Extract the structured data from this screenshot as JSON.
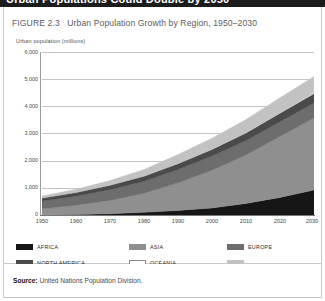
{
  "page_header": {
    "title": "Urban Populations Could Double by 2050"
  },
  "figure": {
    "caption_number": "FIGURE 2.3",
    "caption_title": "Urban Population Growth by Region, 1950–2030",
    "axis_title": "Urban population (millions)"
  },
  "source": {
    "label": "Source:",
    "text": "United Nations Population Division."
  },
  "legend": {
    "items": [
      {
        "label": "AFRICA",
        "color": "#161616"
      },
      {
        "label": "ASIA",
        "color": "#8f8f8f"
      },
      {
        "label": "EUROPE",
        "color": "#6d6d6d"
      },
      {
        "label": "NORTH AMERICA",
        "color": "#4a4a4a"
      },
      {
        "label": "OCEANIA",
        "color": "#ffffff"
      },
      {
        "label": "SOUTH AND CENTRAL AMERICA",
        "color": "#c2c2c2"
      }
    ]
  },
  "chart_data": {
    "type": "area",
    "title": "Urban Population Growth by Region, 1950–2030",
    "subtitle": "FIGURE 2.3",
    "xlabel": "",
    "ylabel": "Urban population (millions)",
    "stacked": true,
    "grid": true,
    "legend_position": "bottom",
    "xlim": [
      1950,
      2030
    ],
    "ylim": [
      0,
      6000
    ],
    "ytick_labels": [
      "0",
      "1,000",
      "2,000",
      "3,000",
      "4,000",
      "5,000",
      "6,000"
    ],
    "ytick_values": [
      0,
      1000,
      2000,
      3000,
      4000,
      5000,
      6000
    ],
    "xtick_labels": [
      "1950",
      "1960",
      "1970",
      "1980",
      "1990",
      "2000",
      "2010",
      "2020",
      "2030"
    ],
    "x": [
      1950,
      1960,
      1970,
      1980,
      1990,
      2000,
      2010,
      2020,
      2030
    ],
    "series": [
      {
        "name": "AFRICA",
        "color": "#161616",
        "values": [
          33,
          53,
          85,
          133,
          203,
          295,
          460,
          680,
          950
        ]
      },
      {
        "name": "ASIA",
        "color": "#8f8f8f",
        "values": [
          232,
          342,
          486,
          697,
          1012,
          1376,
          1770,
          2230,
          2640
        ]
      },
      {
        "name": "EUROPE",
        "color": "#6d6d6d",
        "values": [
          280,
          330,
          390,
          440,
          490,
          520,
          530,
          540,
          545
        ]
      },
      {
        "name": "NORTH AMERICA",
        "color": "#4a4a4a",
        "values": [
          110,
          133,
          160,
          180,
          210,
          240,
          275,
          310,
          340
        ]
      },
      {
        "name": "OCEANIA",
        "color": "#ffffff",
        "values": [
          8,
          11,
          14,
          17,
          19,
          22,
          25,
          29,
          33
        ]
      },
      {
        "name": "SOUTH AND CENTRAL AMERICA",
        "color": "#c2c2c2",
        "values": [
          70,
          108,
          163,
          235,
          315,
          395,
          470,
          540,
          600
        ]
      }
    ],
    "totals": [
      733,
      977,
      1298,
      1702,
      2249,
      2848,
      3530,
      4329,
      5108
    ]
  }
}
